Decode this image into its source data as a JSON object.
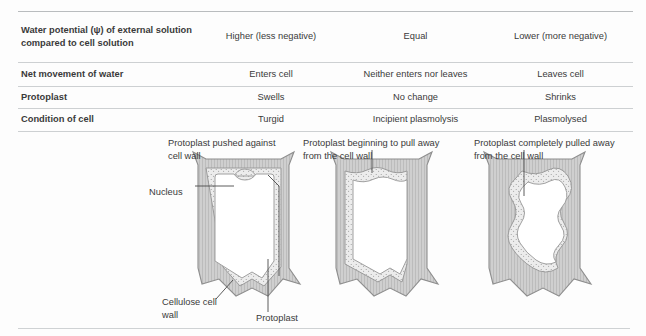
{
  "table": {
    "rows": [
      {
        "label": "Water potential (ψ) of external solution compared to cell solution",
        "values": [
          "Higher (less negative)",
          "Equal",
          "Lower (more negative)"
        ]
      },
      {
        "label": "Net movement of water",
        "values": [
          "Enters cell",
          "Neither enters nor leaves",
          "Leaves cell"
        ]
      },
      {
        "label": "Protoplast",
        "values": [
          "Swells",
          "No change",
          "Shrinks"
        ]
      },
      {
        "label": "Condition of cell",
        "values": [
          "Turgid",
          "Incipient plasmolysis",
          "Plasmolysed"
        ]
      }
    ]
  },
  "diagram": {
    "annotations": {
      "protoplast_pushed": "Protoplast pushed against cell wall",
      "nucleus": "Nucleus",
      "cellulose_cell_wall": "Cellulose cell wall",
      "protoplast": "Protoplast",
      "beginning_to_pull": "Protoplast beginning to pull away from the cell wall",
      "completely_pulled": "Protoplast completely pulled away from the cell wall"
    },
    "colors": {
      "cell_wall_fill": "#cfcfcf",
      "cell_wall_stroke": "#8e8e8e",
      "protoplast_fill": "#e8e8e8",
      "vacuole_fill": "#ffffff",
      "leader_line": "#4a4a4a"
    }
  }
}
